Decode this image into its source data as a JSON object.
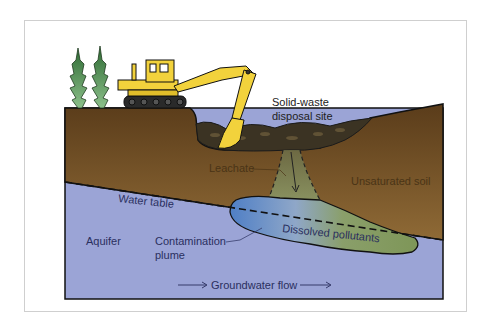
{
  "diagram": {
    "labels": {
      "site_line1": "Solid-waste",
      "site_line2": "disposal site",
      "leachate": "Leachate",
      "unsaturated_soil": "Unsaturated soil",
      "water_table": "Water table",
      "aquifer": "Aquifer",
      "plume_line1": "Contamination",
      "plume_line2": "plume",
      "dissolved": "Dissolved pollutants",
      "flow": "Groundwater flow"
    },
    "colors": {
      "soil": "#6b4a22",
      "soil_light": "#8a6430",
      "aquifer": "#9aa3d4",
      "plume_blue": "#5f86c4",
      "plume_green": "#7f9a5e",
      "excavator": "#f2d23c",
      "tree": "#3f7d3f",
      "waste": "#3b3323"
    }
  }
}
